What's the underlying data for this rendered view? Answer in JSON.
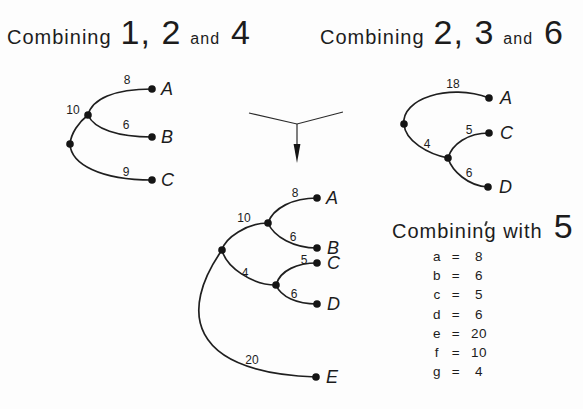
{
  "colors": {
    "background": "#fdfdfd",
    "ink": "#1c1c1c"
  },
  "title_left": {
    "word": "Combining",
    "numbers": "1, 2",
    "conjunction": "and",
    "last_number": "4"
  },
  "title_right": {
    "word": "Combining",
    "numbers": "2, 3",
    "conjunction": "and",
    "last_number": "6"
  },
  "title_bottom": {
    "word": "Combining with",
    "last_number": "5"
  },
  "tree_left": {
    "weights": {
      "upper": "8",
      "parent": "10",
      "middle": "6",
      "lower": "9"
    },
    "leaves": {
      "upper": "A",
      "middle": "B",
      "lower": "C"
    }
  },
  "tree_right": {
    "weights": {
      "upper": "18",
      "parent": "4",
      "middle": "5",
      "lower": "6"
    },
    "leaves": {
      "upper": "A",
      "middle": "C",
      "lower": "D"
    }
  },
  "tree_merged": {
    "weights": {
      "f": "10",
      "a": "8",
      "b": "6",
      "g": "4",
      "c": "5",
      "d": "6",
      "e": "20"
    },
    "leaves": {
      "a": "A",
      "b": "B",
      "c": "C",
      "d": "D",
      "e": "E"
    }
  },
  "legend": {
    "eq": "=",
    "entries": [
      {
        "name": "a",
        "value": "8"
      },
      {
        "name": "b",
        "value": "6"
      },
      {
        "name": "c",
        "value": "5"
      },
      {
        "name": "d",
        "value": "6"
      },
      {
        "name": "e",
        "value": "20"
      },
      {
        "name": "f",
        "value": "10"
      },
      {
        "name": "g",
        "value": "4"
      }
    ]
  }
}
